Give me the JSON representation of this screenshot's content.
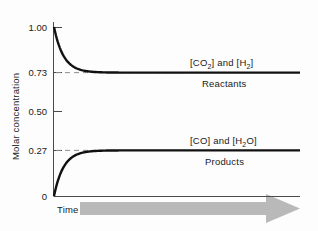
{
  "chart_data": {
    "type": "line",
    "title": "",
    "subtitle": "",
    "xlabel": "Time",
    "ylabel": "Molar concentration",
    "grid": false,
    "legend_position": "inline-right",
    "x": [
      0,
      0.05,
      0.1,
      0.15,
      0.2,
      0.25,
      0.3,
      0.35,
      0.4,
      0.45,
      0.5,
      0.55,
      0.6,
      0.65,
      0.7,
      0.75,
      0.8,
      0.85,
      0.9,
      0.95,
      1.0
    ],
    "xlim": [
      0,
      1
    ],
    "ylim": [
      0,
      1.08
    ],
    "ytick_labels": [
      "1.00",
      "0.73",
      "0.50",
      "0.27",
      "0"
    ],
    "ytick_values": [
      1.0,
      0.73,
      0.5,
      0.27,
      0
    ],
    "xtick_labels": [],
    "reference_lines": [
      {
        "value": 0.73,
        "style": "dashed",
        "label": "0.73"
      },
      {
        "value": 0.27,
        "style": "dashed",
        "label": "0.27"
      }
    ],
    "series": [
      {
        "name": "[CO2] and [H2]",
        "name_display": "[CO₂] and [H₂]",
        "group": "Reactants",
        "start_value": 1.0,
        "equilibrium_value": 0.73,
        "color": "#111111",
        "values": [
          1.0,
          0.9405,
          0.8899,
          0.847,
          0.8105,
          0.7794,
          0.7531,
          0.7307,
          0.7117,
          0.6955,
          0.6818,
          0.6701,
          0.6602,
          0.6517,
          0.6446,
          0.6385,
          0.6333,
          0.6289,
          0.6252,
          0.622,
          0.6193
        ]
      },
      {
        "name": "[CO] and [H2O]",
        "name_display": "[CO] and [H₂O]",
        "group": "Products",
        "start_value": 0.0,
        "equilibrium_value": 0.27,
        "color": "#111111",
        "values": [
          0.0,
          0.0595,
          0.1101,
          0.153,
          0.1895,
          0.2206,
          0.2469,
          0.2693,
          0.2883,
          0.3045,
          0.3182,
          0.3299,
          0.3398,
          0.3483,
          0.3554,
          0.3615,
          0.3667,
          0.3711,
          0.3748,
          0.378,
          0.3807
        ]
      }
    ],
    "annotations": [
      {
        "text": "[CO₂] and [H₂]",
        "position": "above-reactants-line"
      },
      {
        "text": "Reactants",
        "position": "below-reactants-line"
      },
      {
        "text": "[CO] and [H₂O]",
        "position": "above-products-line"
      },
      {
        "text": "Products",
        "position": "below-products-line"
      }
    ],
    "arrow": {
      "direction": "right",
      "color": "#b9b9b9",
      "label": "Time"
    }
  },
  "labels": {
    "y_axis_title": "Molar concentration",
    "tick_100": "1.00",
    "tick_073": "0.73",
    "tick_050": "0.50",
    "tick_027": "0.27",
    "tick_0": "0",
    "time": "Time",
    "reactants_formula_pre": "[CO",
    "reactants_formula_sub1": "2",
    "reactants_formula_mid": "] and [H",
    "reactants_formula_sub2": "2",
    "reactants_formula_post": "]",
    "reactants_group": "Reactants",
    "products_formula_pre": "[CO] and [H",
    "products_formula_sub1": "2",
    "products_formula_post": "O]",
    "products_group": "Products"
  },
  "colors": {
    "curve": "#111111",
    "axis": "#3a3a3a",
    "dashed": "#8e8e8e",
    "arrow": "#b9b9b9",
    "background": "#fdfdfd"
  }
}
